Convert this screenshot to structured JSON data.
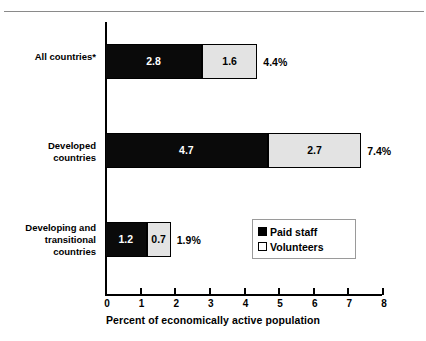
{
  "chart_data": {
    "type": "bar",
    "orientation": "horizontal",
    "stacked": true,
    "title": "",
    "xlabel": "Percent of economically active population",
    "ylabel": "",
    "xlim": [
      0,
      8
    ],
    "xticks": [
      "0",
      "1",
      "2",
      "3",
      "4",
      "5",
      "6",
      "7",
      "8"
    ],
    "grid": false,
    "legend_position": "inside-lower-right",
    "categories": [
      "All countries*",
      "Developed countries",
      "Developing and transitional countries"
    ],
    "category_lines": [
      [
        "All countries*"
      ],
      [
        "Developed",
        "countries"
      ],
      [
        "Developing and",
        "transitional",
        "countries"
      ]
    ],
    "series": [
      {
        "name": "Paid staff",
        "color": "#000000",
        "values": [
          2.8,
          4.7,
          1.2
        ]
      },
      {
        "name": "Volunteers",
        "color": "#e3e3e3",
        "values": [
          1.6,
          2.7,
          0.7
        ]
      }
    ],
    "bar_value_labels": [
      [
        "2.8",
        "1.6"
      ],
      [
        "4.7",
        "2.7"
      ],
      [
        "1.2",
        "0.7"
      ]
    ],
    "totals": [
      4.4,
      7.4,
      1.9
    ],
    "total_labels": [
      "4.4%",
      "7.4%",
      "1.9%"
    ]
  },
  "legend": {
    "items": [
      {
        "label": "Paid staff",
        "swatch": "filled-black-square"
      },
      {
        "label": "Volunteers",
        "swatch": "outlined-white-square"
      }
    ]
  },
  "axis": {
    "x_title": "Percent of economically active population"
  }
}
